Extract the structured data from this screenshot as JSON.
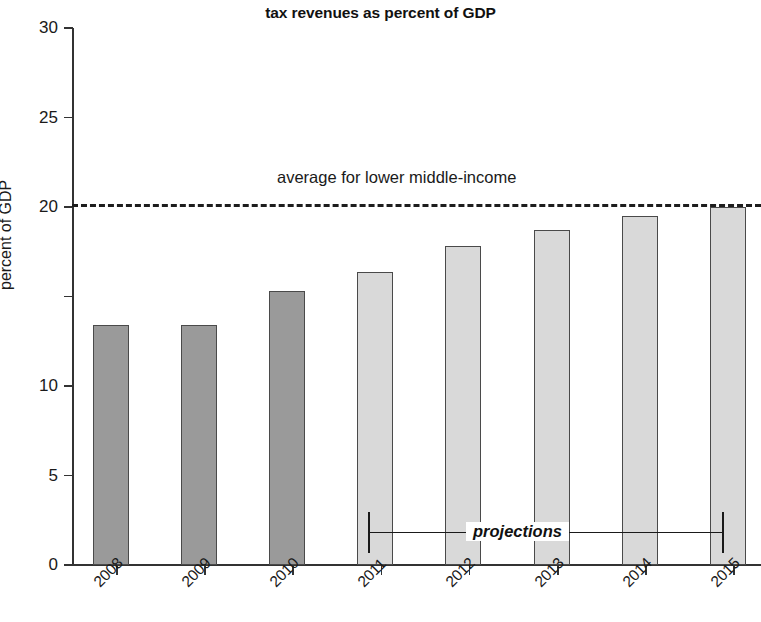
{
  "chart_data": {
    "type": "bar",
    "title": "tax revenues as percent of GDP",
    "xlabel": "",
    "ylabel": "percent of GDP",
    "categories": [
      "2008",
      "2009",
      "2010",
      "2011",
      "2012",
      "2013",
      "2014",
      "2015"
    ],
    "values": [
      13.4,
      13.4,
      15.3,
      16.4,
      17.8,
      18.7,
      19.5,
      20.0
    ],
    "series": [
      {
        "name": "tax revenues as percent of GDP",
        "values": [
          13.4,
          13.4,
          15.3,
          16.4,
          17.8,
          18.7,
          19.5,
          20.0
        ]
      }
    ],
    "bar_styles": [
      "actual",
      "actual",
      "actual",
      "projection",
      "projection",
      "projection",
      "projection",
      "projection"
    ],
    "ylim": [
      0,
      30
    ],
    "yticks": [
      0,
      5,
      10,
      15,
      20,
      25,
      30
    ],
    "ytick_labels": [
      "0",
      "5",
      "10",
      "15",
      "20",
      "25",
      "30"
    ],
    "ytick_labels_visible": [
      "0",
      "5",
      "10",
      "",
      "20",
      "25",
      "30"
    ],
    "grid": false,
    "legend": "none",
    "annotations": [
      {
        "name": "reference-line-label",
        "text": "average for lower middle-income",
        "value": 20.0,
        "style": "dashed-horizontal-line"
      },
      {
        "name": "projections-bracket-label",
        "text": "projections",
        "spans_categories": [
          "2011",
          "2015"
        ],
        "style": "bold-italic-bracket"
      }
    ],
    "colors": {
      "actual_bar_fill": "#9a9a9a",
      "projection_bar_fill": "#d9d9d9",
      "bar_edge": "#4a4a4a",
      "axis": "#333333",
      "reference_line": "#1d1d1d",
      "text": "#1a1a1a"
    }
  }
}
